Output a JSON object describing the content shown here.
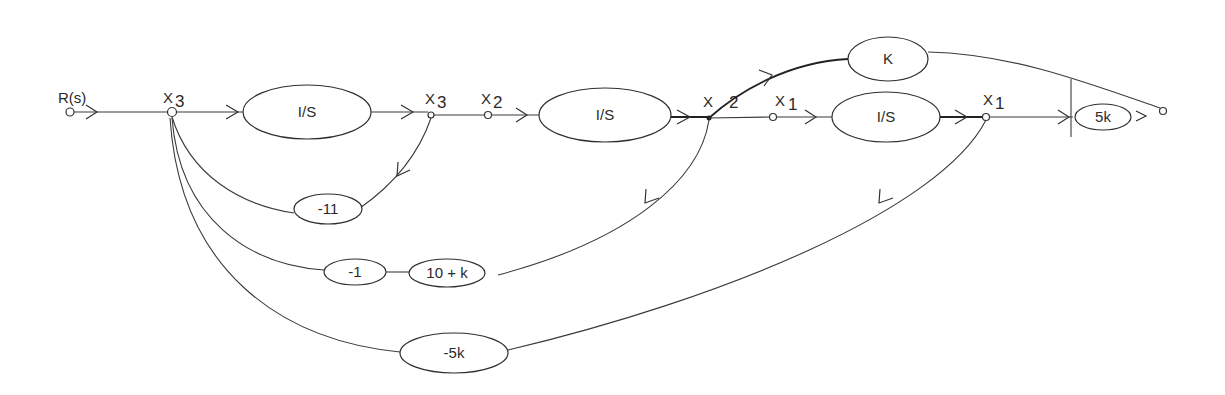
{
  "diagram": {
    "type": "signal-flow-graph",
    "input_label": "R(s)",
    "nodes": {
      "input": "R(s)",
      "x3_sum": "X3",
      "x3": "X3",
      "x2_in": "X2",
      "x2": "X2",
      "x1_in": "X1",
      "x1": "X1"
    },
    "node_labels": {
      "x3_sum": {
        "letter": "X",
        "sub": "3"
      },
      "x3": {
        "letter": "X",
        "sub": "3"
      },
      "x2_in": {
        "letter": "X",
        "sub": "2"
      },
      "x2": {
        "letter": "X",
        "sub": "2"
      },
      "x1_in": {
        "letter": "X",
        "sub": "1"
      },
      "x1": {
        "letter": "X",
        "sub": "1"
      }
    },
    "blocks": {
      "integrator_1": "I/S",
      "integrator_2": "I/S",
      "integrator_3": "I/S",
      "gain_k": "K",
      "output_gain": "5k",
      "feedback_11": "-11",
      "feedback_1": "-1",
      "feedback_10k": "10 + k",
      "feedback_5k": "-5k"
    },
    "branches": [
      {
        "from": "R(s)",
        "to": "X3",
        "gain": "1"
      },
      {
        "from": "X3",
        "to": "X3",
        "gain": "1/S"
      },
      {
        "from": "X3",
        "to": "X2",
        "gain": "1"
      },
      {
        "from": "X2",
        "to": "X2",
        "gain": "1/S"
      },
      {
        "from": "X2",
        "to": "X1",
        "gain": "1"
      },
      {
        "from": "X1",
        "to": "X1",
        "gain": "1/S"
      },
      {
        "from": "X1",
        "to": "output",
        "gain": "5k"
      },
      {
        "from": "X2",
        "to": "output",
        "gain": "K"
      },
      {
        "from": "X3",
        "to": "X3 (sum)",
        "gain": "-11"
      },
      {
        "from": "X2",
        "to": "X3 (sum)",
        "gain": "(10 + k)(-1)"
      },
      {
        "from": "X1",
        "to": "X3 (sum)",
        "gain": "-5k"
      }
    ]
  }
}
